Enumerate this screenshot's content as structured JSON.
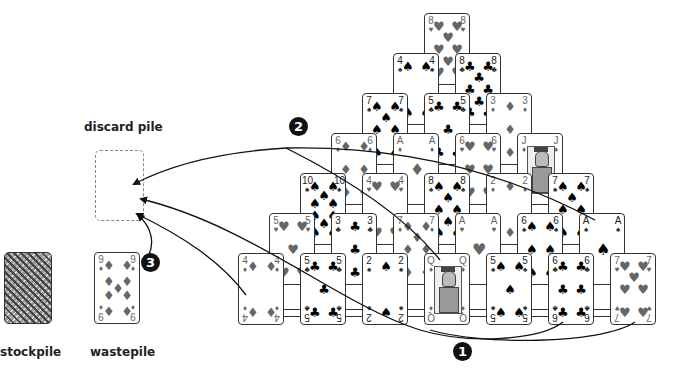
{
  "labels": {
    "discard": "discard pile",
    "stockpile": "stockpile",
    "wastepile": "wastepile"
  },
  "markers": [
    "1",
    "2",
    "3"
  ],
  "colors": {
    "black_suit": "#222222",
    "red_suit": "#666666",
    "card_border": "#333333",
    "discard_border": "#888888"
  },
  "icons": {
    "spade": "♠",
    "heart": "♥",
    "diamond": "♦",
    "club": "♣"
  },
  "wastepile_card": {
    "rank": "9",
    "suit": "diamond"
  },
  "pyramid": {
    "rows": [
      [
        {
          "rank": "8",
          "suit": "heart"
        }
      ],
      [
        {
          "rank": "4",
          "suit": "spade"
        },
        {
          "rank": "8",
          "suit": "club"
        }
      ],
      [
        {
          "rank": "7",
          "suit": "spade"
        },
        {
          "rank": "5",
          "suit": "club"
        },
        {
          "rank": "3",
          "suit": "diamond"
        }
      ],
      [
        {
          "rank": "6",
          "suit": "diamond"
        },
        {
          "rank": "A",
          "suit": "diamond"
        },
        {
          "rank": "6",
          "suit": "heart"
        },
        {
          "rank": "J",
          "suit": "diamond"
        }
      ],
      [
        {
          "rank": "10",
          "suit": "spade"
        },
        {
          "rank": "4",
          "suit": "heart"
        },
        {
          "rank": "8",
          "suit": "spade"
        },
        {
          "rank": "2",
          "suit": "diamond"
        },
        {
          "rank": "7",
          "suit": "spade"
        }
      ],
      [
        {
          "rank": "5",
          "suit": "heart"
        },
        {
          "rank": "3",
          "suit": "club"
        },
        {
          "rank": "7",
          "suit": "diamond"
        },
        {
          "rank": "A",
          "suit": "heart"
        },
        {
          "rank": "6",
          "suit": "spade"
        },
        {
          "rank": "A",
          "suit": "spade"
        }
      ],
      [
        {
          "rank": "4",
          "suit": "diamond"
        },
        {
          "rank": "5",
          "suit": "club"
        },
        {
          "rank": "2",
          "suit": "spade"
        },
        {
          "rank": "Q",
          "suit": "diamond"
        },
        {
          "rank": "5",
          "suit": "spade"
        },
        {
          "rank": "6",
          "suit": "club"
        },
        {
          "rank": "7",
          "suit": "heart"
        }
      ]
    ]
  }
}
